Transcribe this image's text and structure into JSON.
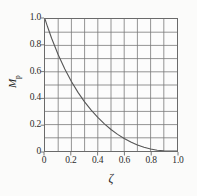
{
  "chart_data": {
    "type": "line",
    "title": "",
    "subtitle": "",
    "xlabel": "ζ",
    "ylabel": "M",
    "ylabel_subscript": "p",
    "xlim": [
      0,
      1.0
    ],
    "ylim": [
      0,
      1.0
    ],
    "grid": true,
    "grid_divisions_x": 10,
    "grid_divisions_y": 10,
    "legend": "none",
    "xticks": [
      "0",
      "0.2",
      "0.4",
      "0.6",
      "0.8",
      "1.0"
    ],
    "xtick_values": [
      0,
      0.2,
      0.4,
      0.6,
      0.8,
      1.0
    ],
    "yticks": [
      "0",
      "0.2",
      "0.4",
      "0.6",
      "0.8",
      "1.0"
    ],
    "ytick_values": [
      0,
      0.2,
      0.4,
      0.6,
      0.8,
      1.0
    ],
    "series": [
      {
        "name": "Mp",
        "color": "#555555",
        "x": [
          0.0,
          0.02,
          0.05,
          0.1,
          0.15,
          0.2,
          0.25,
          0.3,
          0.35,
          0.4,
          0.45,
          0.5,
          0.55,
          0.6,
          0.65,
          0.7,
          0.75,
          0.8,
          0.85,
          0.9,
          0.95,
          1.0
        ],
        "y": [
          1.0,
          0.939,
          0.854,
          0.729,
          0.621,
          0.527,
          0.444,
          0.372,
          0.309,
          0.254,
          0.206,
          0.163,
          0.126,
          0.095,
          0.068,
          0.046,
          0.028,
          0.015,
          0.006,
          0.0015,
          0.0001,
          0.0
        ]
      }
    ],
    "colors": {
      "frame": "#6a6a6a",
      "gridline": "#777777",
      "curve": "#555555",
      "background": "#fbfbfa",
      "text": "#1f1f1f"
    }
  },
  "axes": {
    "y": {
      "ticks": [
        {
          "label": "1.0",
          "value": 1.0
        },
        {
          "label": "0.8",
          "value": 0.8
        },
        {
          "label": "0.6",
          "value": 0.6
        },
        {
          "label": "0.4",
          "value": 0.4
        },
        {
          "label": "0.2",
          "value": 0.2
        },
        {
          "label": "0",
          "value": 0.0
        }
      ],
      "title": "M",
      "title_subscript": "p"
    },
    "x": {
      "ticks": [
        {
          "label": "0",
          "value": 0.0
        },
        {
          "label": "0.2",
          "value": 0.2
        },
        {
          "label": "0.4",
          "value": 0.4
        },
        {
          "label": "0.6",
          "value": 0.6
        },
        {
          "label": "0.8",
          "value": 0.8
        },
        {
          "label": "1.0",
          "value": 1.0
        }
      ],
      "title": "ζ"
    }
  }
}
